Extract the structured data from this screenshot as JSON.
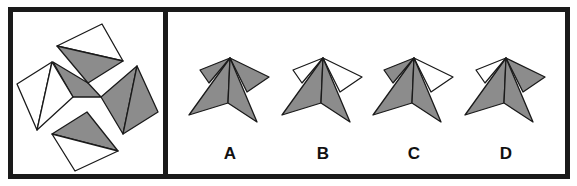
{
  "colors": {
    "shaded": "#8c8c8c",
    "blank": "#ffffff",
    "stroke": "#1a1a1a",
    "border": "#1a1a1a"
  },
  "question": {
    "description": "Pinwheel of four squares each split by a diagonal; gray central hub",
    "pieces": [
      {
        "name": "top-square",
        "shaded_halves": [
          "lower"
        ],
        "diagonal": "left-to-right"
      },
      {
        "name": "left-square",
        "shaded_halves": [],
        "diagonal": "top-to-bottom"
      },
      {
        "name": "right-square",
        "shaded_halves": [
          "both"
        ],
        "diagonal": "top-to-bottom"
      },
      {
        "name": "bottom-square",
        "shaded_halves": [
          "upper"
        ],
        "diagonal": "left-to-right"
      }
    ]
  },
  "options": [
    {
      "label": "A",
      "left_flap": "shaded",
      "right_flap": "shaded"
    },
    {
      "label": "B",
      "left_flap": "blank",
      "right_flap": "blank"
    },
    {
      "label": "C",
      "left_flap": "shaded",
      "right_flap": "blank"
    },
    {
      "label": "D",
      "left_flap": "blank",
      "right_flap": "shaded"
    }
  ]
}
